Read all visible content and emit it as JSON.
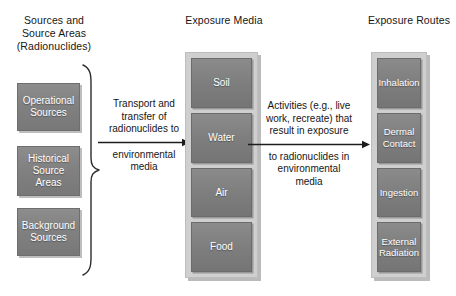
{
  "headers": {
    "sources": "Sources and\nSource Areas\n(Radionuclides)",
    "media": "Exposure Media",
    "routes": "Exposure Routes"
  },
  "sources": {
    "items": [
      {
        "label": "Operational\nSources"
      },
      {
        "label": "Historical\nSource\nAreas"
      },
      {
        "label": "Background\nSources"
      }
    ]
  },
  "exposure_media": {
    "items": [
      {
        "label": "Soil"
      },
      {
        "label": "Water"
      },
      {
        "label": "Air"
      },
      {
        "label": "Food"
      }
    ]
  },
  "exposure_routes": {
    "items": [
      {
        "label": "Inhalation"
      },
      {
        "label": "Dermal\nContact"
      },
      {
        "label": "Ingestion"
      },
      {
        "label": "External\nRadiation"
      }
    ]
  },
  "arrows": {
    "left": {
      "above": "Transport and\ntransfer of\nradionuclides to",
      "below": "environmental\nmedia"
    },
    "right": {
      "above": "Activities (e.g., live\nwork, recreate) that\nresult in exposure",
      "below": "to radionuclides in\nenvironmental\nmedia"
    }
  },
  "colors": {
    "box_fill": "#7e7e7e",
    "panel_fill": "#cfcfcf",
    "box_text": "#ffffff",
    "body_text": "#161616",
    "background": "#ffffff"
  }
}
